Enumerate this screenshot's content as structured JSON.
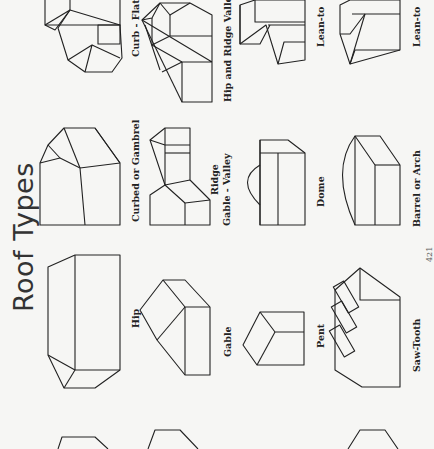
{
  "page": {
    "title": "Roof Types",
    "page_number": "421",
    "orientation": "rotated 90 degrees"
  },
  "roof_types": [
    {
      "label": "Curb - Flat"
    },
    {
      "label": "Curbed or Gambrel"
    },
    {
      "label": "Hip"
    },
    {
      "label": "Hip and Ridge Valley"
    },
    {
      "label_line1": "Ridge",
      "label_line2": "Gable - Valley"
    },
    {
      "label": "Gable"
    },
    {
      "label": "Lean-to"
    },
    {
      "label": "Dome"
    },
    {
      "label": "Pent"
    },
    {
      "label": "Lean-to"
    },
    {
      "label": "Barrel or Arch"
    },
    {
      "label": "Saw-Tooth"
    }
  ],
  "colors": {
    "background": "#f6f6f4",
    "ink": "#222222"
  }
}
